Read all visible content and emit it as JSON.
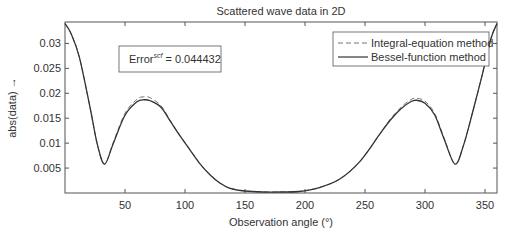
{
  "chart_data": {
    "type": "line",
    "title": "Scattered wave data in 2D",
    "xlabel": "Observation angle (°)",
    "ylabel": "abs(data)  →",
    "xlim": [
      0,
      360
    ],
    "ylim": [
      0,
      0.0343
    ],
    "grid": false,
    "legend_position": "upper right",
    "x_ticks": [
      50,
      100,
      150,
      200,
      250,
      300,
      350
    ],
    "x_tick_labels": [
      "50",
      "100",
      "150",
      "200",
      "250",
      "300",
      "350"
    ],
    "y_ticks": [
      0.005,
      0.01,
      0.015,
      0.02,
      0.025,
      0.03
    ],
    "y_tick_labels": [
      "0.005",
      "0.01",
      "0.015",
      "0.02",
      "0.025",
      "0.03"
    ],
    "annotation": {
      "base": "Error",
      "superscript": "scf",
      "value_text": " = 0.044432"
    },
    "x": [
      0,
      5,
      12,
      21,
      27,
      33,
      40,
      50,
      60,
      66,
      71,
      80,
      88,
      96,
      104,
      112,
      121,
      129,
      137,
      150,
      165,
      180,
      195,
      212,
      229,
      246,
      262,
      271,
      280,
      288,
      293,
      300,
      308,
      316,
      325,
      332,
      340,
      348,
      355,
      360
    ],
    "series": [
      {
        "name": "Integral-equation method",
        "style": "dashed",
        "values": [
          0.034,
          0.032,
          0.0272,
          0.017,
          0.0097,
          0.0058,
          0.01,
          0.016,
          0.0188,
          0.0193,
          0.0191,
          0.0175,
          0.0144,
          0.0115,
          0.0087,
          0.006,
          0.0036,
          0.002,
          0.001,
          0.0004,
          0.0002,
          0.0002,
          0.0003,
          0.0011,
          0.0028,
          0.0064,
          0.0117,
          0.0148,
          0.0172,
          0.0187,
          0.019,
          0.0184,
          0.016,
          0.011,
          0.0058,
          0.0095,
          0.0165,
          0.024,
          0.031,
          0.034
        ]
      },
      {
        "name": "Bessel-function method",
        "style": "solid",
        "values": [
          0.034,
          0.032,
          0.0272,
          0.017,
          0.0097,
          0.0058,
          0.0098,
          0.0156,
          0.0183,
          0.0187,
          0.0185,
          0.0172,
          0.0143,
          0.0114,
          0.0087,
          0.006,
          0.0036,
          0.002,
          0.001,
          0.0004,
          0.0002,
          0.0002,
          0.0003,
          0.0011,
          0.0028,
          0.0064,
          0.0117,
          0.0146,
          0.0169,
          0.0183,
          0.0186,
          0.018,
          0.0157,
          0.0108,
          0.0058,
          0.0095,
          0.0165,
          0.024,
          0.031,
          0.034
        ]
      }
    ]
  },
  "colors": {
    "axis": "#555555",
    "line": "#333333",
    "dashed": "#777777",
    "text": "#333333"
  }
}
